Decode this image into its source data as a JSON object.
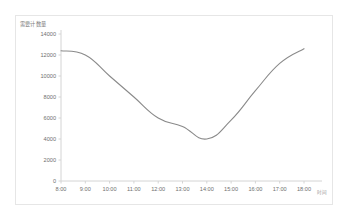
{
  "chart_data": {
    "type": "line",
    "title": "",
    "ylabel": "需要计数量",
    "xlabel": "",
    "x_unit_label": "时间",
    "categories": [
      "8:00",
      "9:00",
      "10:00",
      "11:00",
      "12:00",
      "13:00",
      "14:00",
      "15:00",
      "16:00",
      "17:00",
      "18:00"
    ],
    "values": [
      12400,
      12000,
      10000,
      8000,
      6000,
      5200,
      4000,
      5800,
      8600,
      11200,
      12600
    ],
    "ylim": [
      0,
      14000
    ],
    "y_ticks": [
      "0",
      "2000",
      "4000",
      "6000",
      "8000",
      "10000",
      "12000",
      "14000"
    ],
    "y_tick_values": [
      0,
      2000,
      4000,
      6000,
      8000,
      10000,
      12000,
      14000
    ],
    "grid": false,
    "legend": false,
    "line_color": "#8a8a8a",
    "axis_color": "#d4d4d4",
    "border_color": "#e6e6e6",
    "markers": false
  }
}
